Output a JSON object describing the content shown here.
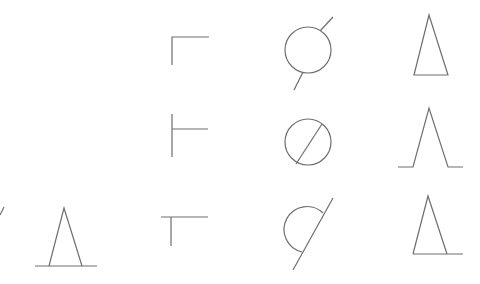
{
  "canvas": {
    "width": 480,
    "height": 284,
    "background": "#ffffff",
    "stroke_color": "#6e6e6e"
  },
  "symbols": [
    {
      "id": "edge-slash",
      "kind": "partial-line"
    },
    {
      "id": "triangle-left",
      "kind": "triangle-on-baseline"
    },
    {
      "id": "corner-top",
      "kind": "corner-bracket"
    },
    {
      "id": "tee-left",
      "kind": "tee-right-branch"
    },
    {
      "id": "tee-top",
      "kind": "tee-down"
    },
    {
      "id": "circle-line-outside",
      "kind": "circle-with-outer-line"
    },
    {
      "id": "circle-line-inside",
      "kind": "circle-with-inner-diagonal"
    },
    {
      "id": "half-circle-line",
      "kind": "half-circle-with-line"
    },
    {
      "id": "triangle-closed",
      "kind": "closed-triangle"
    },
    {
      "id": "triangle-feet",
      "kind": "open-triangle-with-feet"
    },
    {
      "id": "triangle-extended-base",
      "kind": "triangle-with-extended-base"
    }
  ]
}
